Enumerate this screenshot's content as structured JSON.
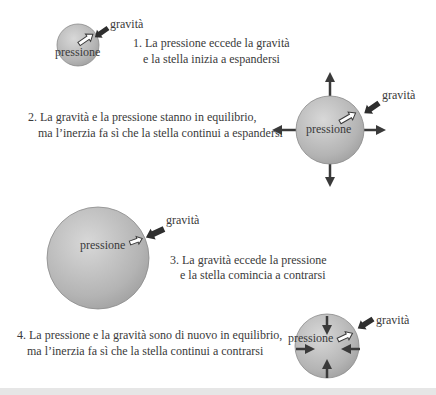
{
  "diagram": {
    "colors": {
      "star_light": "#d4d4d4",
      "star_dark": "#9a9a9a",
      "star_stroke": "#8a8a8a",
      "arrow_dark": "#3a3a3a",
      "text": "#3a3a3a",
      "background": "#ffffff",
      "bottom_strip": "#e6e6e6"
    },
    "stages": [
      {
        "id": 1,
        "star_label": "pressione",
        "gravity_label": "gravità",
        "caption_line1": "1. La pressione eccede la gravità",
        "caption_line2": "e la stella inizia a espandersi",
        "outer_arrows": "none"
      },
      {
        "id": 2,
        "star_label": "pressione",
        "gravity_label": "gravità",
        "caption_line1": "2. La gravità e la pressione stanno in equilibrio,",
        "caption_line2": "ma l’inerzia fa sì che la stella continui a espandersi",
        "outer_arrows": "outward"
      },
      {
        "id": 3,
        "star_label": "pressione",
        "gravity_label": "gravità",
        "caption_line1": "3. La gravità eccede la pressione",
        "caption_line2": "e la stella comincia a contrarsi",
        "outer_arrows": "none"
      },
      {
        "id": 4,
        "star_label": "pressione",
        "gravity_label": "gravità",
        "caption_line1": "4. La pressione e la gravità sono di nuovo in equilibrio,",
        "caption_line2": "ma l’inerzia fa sì che la stella continui a contrarsi",
        "outer_arrows": "inward"
      }
    ]
  }
}
